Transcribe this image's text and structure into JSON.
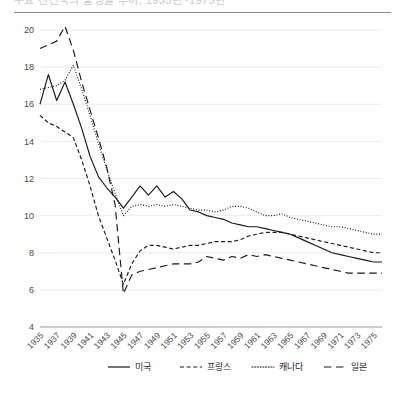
{
  "title": {
    "text": "주요 선진국의 출생률 추이, 1935년~1975년",
    "truncated": true
  },
  "legend": {
    "position": "bottom",
    "items": [
      {
        "label": "미국",
        "dash": "none",
        "name": "legend-item-usa"
      },
      {
        "label": "프랑스",
        "dash": "short",
        "name": "legend-item-france"
      },
      {
        "label": "캐나다",
        "dash": "dotted",
        "name": "legend-item-canada"
      },
      {
        "label": "일본",
        "dash": "long",
        "name": "legend-item-japan"
      }
    ]
  },
  "axes": {
    "y_ticks": [
      "20",
      "18",
      "16",
      "14",
      "12",
      "10",
      "8",
      "6",
      "4"
    ],
    "x_ticks": [
      "1935",
      "1937",
      "1939",
      "1941",
      "1943",
      "1945",
      "1947",
      "1949",
      "1951",
      "1953",
      "1955",
      "1957",
      "1959",
      "1961",
      "1963",
      "1965",
      "1967",
      "1969",
      "1971",
      "1973",
      "1975"
    ]
  },
  "chart_data": {
    "type": "line",
    "title": "주요 선진국의 출생률 추이, 1935년~1975년",
    "xlabel": "",
    "ylabel": "",
    "xlim": [
      1935,
      1976
    ],
    "ylim": [
      4,
      20
    ],
    "ystep": 2,
    "grid": true,
    "legend_position": "bottom",
    "x": [
      1935,
      1936,
      1937,
      1938,
      1939,
      1940,
      1941,
      1942,
      1943,
      1944,
      1945,
      1946,
      1947,
      1948,
      1949,
      1950,
      1951,
      1952,
      1953,
      1954,
      1955,
      1956,
      1957,
      1958,
      1959,
      1960,
      1961,
      1962,
      1963,
      1964,
      1965,
      1966,
      1967,
      1968,
      1969,
      1970,
      1971,
      1972,
      1973,
      1974,
      1975,
      1976
    ],
    "series": [
      {
        "name": "미국",
        "dash": "none",
        "values": [
          16.0,
          17.6,
          16.2,
          17.2,
          16.0,
          14.7,
          13.2,
          12.1,
          11.5,
          11.0,
          10.4,
          11.0,
          11.6,
          11.1,
          11.6,
          11.0,
          11.3,
          10.9,
          10.3,
          10.2,
          10.0,
          9.9,
          9.8,
          9.6,
          9.5,
          9.4,
          9.4,
          9.3,
          9.2,
          9.1,
          9.0,
          8.8,
          8.6,
          8.4,
          8.2,
          8.0,
          7.9,
          7.8,
          7.7,
          7.6,
          7.5,
          7.5
        ]
      },
      {
        "name": "프랑스",
        "dash": "short",
        "values": [
          15.4,
          15.0,
          14.8,
          14.5,
          14.2,
          13.0,
          11.6,
          10.0,
          8.8,
          7.6,
          6.3,
          7.4,
          8.1,
          8.4,
          8.4,
          8.3,
          8.2,
          8.3,
          8.4,
          8.4,
          8.5,
          8.6,
          8.6,
          8.6,
          8.7,
          8.9,
          9.0,
          9.1,
          9.1,
          9.1,
          9.0,
          8.9,
          8.8,
          8.7,
          8.6,
          8.5,
          8.4,
          8.3,
          8.2,
          8.1,
          8.0,
          8.0
        ]
      },
      {
        "name": "캐나다",
        "dash": "dotted",
        "values": [
          16.8,
          16.9,
          17.0,
          17.3,
          18.1,
          16.8,
          15.4,
          13.9,
          12.5,
          11.2,
          10.0,
          10.5,
          10.6,
          10.5,
          10.6,
          10.5,
          10.6,
          10.5,
          10.4,
          10.3,
          10.3,
          10.2,
          10.3,
          10.5,
          10.5,
          10.4,
          10.2,
          10.0,
          10.0,
          10.1,
          9.9,
          9.8,
          9.7,
          9.6,
          9.5,
          9.4,
          9.4,
          9.3,
          9.2,
          9.1,
          9.0,
          9.0
        ]
      },
      {
        "name": "일본",
        "dash": "long",
        "values": [
          19.0,
          19.2,
          19.4,
          20.2,
          18.9,
          17.2,
          15.7,
          14.2,
          12.6,
          10.6,
          5.8,
          6.8,
          7.0,
          7.1,
          7.2,
          7.3,
          7.4,
          7.4,
          7.4,
          7.5,
          7.8,
          7.7,
          7.6,
          7.8,
          7.7,
          7.9,
          7.8,
          7.9,
          7.8,
          7.7,
          7.6,
          7.5,
          7.4,
          7.3,
          7.2,
          7.1,
          7.0,
          6.9,
          6.9,
          6.9,
          6.9,
          6.9
        ]
      }
    ]
  }
}
